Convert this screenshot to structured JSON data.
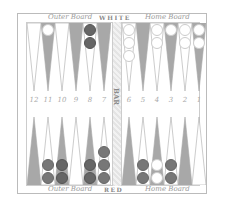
{
  "labels": {
    "top_left": "Outer Board",
    "top_center": "WHITE",
    "top_right": "Home Board",
    "bottom_left": "Outer Board",
    "bottom_center": "RED",
    "bottom_right": "Home Board",
    "bar": "BAR"
  },
  "point_numbers": [
    "12",
    "11",
    "10",
    "9",
    "8",
    "7",
    "6",
    "5",
    "4",
    "3",
    "2",
    "1"
  ],
  "colors": {
    "light_point": "#ffffff",
    "dark_point": "#a8a8a8",
    "white_checker": "#ffffff",
    "red_checker": "#6e6e6e"
  },
  "top_points": [
    {
      "x": 27,
      "shade": "light",
      "checkers": []
    },
    {
      "x": 41,
      "shade": "dark",
      "checkers": [
        "white"
      ]
    },
    {
      "x": 55,
      "shade": "light",
      "checkers": []
    },
    {
      "x": 69,
      "shade": "dark",
      "checkers": []
    },
    {
      "x": 83,
      "shade": "light",
      "checkers": [
        "dark",
        "dark"
      ]
    },
    {
      "x": 97,
      "shade": "dark",
      "checkers": []
    },
    {
      "x": 122,
      "shade": "light",
      "checkers": [
        "white",
        "white",
        "white"
      ]
    },
    {
      "x": 136,
      "shade": "dark",
      "checkers": []
    },
    {
      "x": 150,
      "shade": "light",
      "checkers": [
        "white",
        "white"
      ]
    },
    {
      "x": 164,
      "shade": "dark",
      "checkers": [
        "white"
      ]
    },
    {
      "x": 178,
      "shade": "light",
      "checkers": [
        "white",
        "white"
      ]
    },
    {
      "x": 192,
      "shade": "dark",
      "checkers": [
        "white",
        "white"
      ]
    }
  ],
  "bottom_points": [
    {
      "x": 27,
      "shade": "dark",
      "checkers": []
    },
    {
      "x": 41,
      "shade": "light",
      "checkers": [
        "red",
        "red"
      ]
    },
    {
      "x": 55,
      "shade": "dark",
      "checkers": [
        "dark",
        "dark"
      ]
    },
    {
      "x": 69,
      "shade": "light",
      "checkers": []
    },
    {
      "x": 83,
      "shade": "dark",
      "checkers": [
        "dark",
        "dark"
      ]
    },
    {
      "x": 97,
      "shade": "light",
      "checkers": [
        "red",
        "red",
        "red"
      ]
    },
    {
      "x": 122,
      "shade": "dark",
      "checkers": []
    },
    {
      "x": 136,
      "shade": "light",
      "checkers": [
        "red",
        "red"
      ]
    },
    {
      "x": 150,
      "shade": "dark",
      "checkers": [
        "white",
        "white"
      ]
    },
    {
      "x": 164,
      "shade": "light",
      "checkers": [
        "red",
        "red"
      ]
    },
    {
      "x": 178,
      "shade": "dark",
      "checkers": []
    },
    {
      "x": 192,
      "shade": "light",
      "checkers": []
    }
  ]
}
